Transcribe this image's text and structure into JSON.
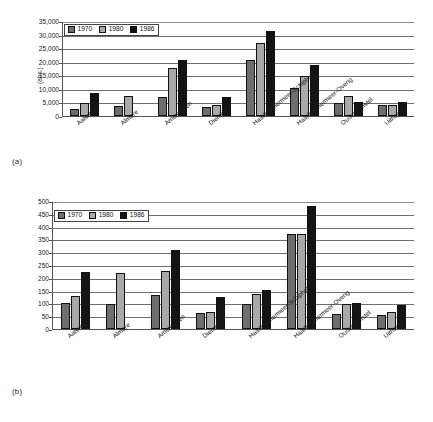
{
  "figure": {
    "panel_a_label": "(a)",
    "panel_b_label": "(b)"
  },
  "colors": {
    "series_1970": "#6e6e6e",
    "series_1980": "#a9a9a9",
    "series_1986": "#141414",
    "gridline": "#6f6f6f",
    "axis": "#555555"
  },
  "chart_data": [
    {
      "type": "bar",
      "id": "a",
      "title": "",
      "panel_label": "(a)",
      "xlabel": "",
      "ylabel": "(abs.)",
      "ylim": [
        0,
        35000
      ],
      "yticks": [
        0,
        5000,
        10000,
        15000,
        20000,
        25000,
        30000,
        35000
      ],
      "ytick_labels": [
        "0",
        "5,000",
        "10,000",
        "15,000",
        "20,000",
        "25,000",
        "30,000",
        "35,000"
      ],
      "grid": true,
      "legend_position": "top-left",
      "categories": [
        "Aalsmeer",
        "Almere",
        "Amstelveen",
        "Diemen",
        "Haarlemmermeer-Schiphol",
        "Haarlemmermeer-Overig",
        "Ouder-Amstel",
        "Uithoorn"
      ],
      "series": [
        {
          "name": "1970",
          "color": "#6e6e6e",
          "values": [
            2700,
            3700,
            6900,
            3400,
            20800,
            10200,
            4800,
            4100
          ]
        },
        {
          "name": "1980",
          "color": "#a9a9a9",
          "values": [
            4800,
            7400,
            17800,
            4000,
            27000,
            14800,
            7200,
            4000
          ]
        },
        {
          "name": "1986",
          "color": "#141414",
          "values": [
            8500,
            0,
            20800,
            6900,
            31500,
            18900,
            5000,
            5300
          ]
        }
      ]
    },
    {
      "type": "bar",
      "id": "b",
      "title": "",
      "panel_label": "(b)",
      "xlabel": "",
      "ylabel": "",
      "ylim": [
        0,
        500
      ],
      "yticks": [
        0,
        50,
        100,
        150,
        200,
        250,
        300,
        350,
        400,
        450,
        500
      ],
      "ytick_labels": [
        "0",
        "50",
        "100",
        "150",
        "200",
        "250",
        "300",
        "350",
        "400",
        "450",
        "500"
      ],
      "grid": true,
      "legend_position": "top-left",
      "categories": [
        "Aalsmeer",
        "Almere",
        "Amstelveen",
        "Diemen",
        "Haarlemmermeer-Schiphol",
        "Haarlemmermeer-Overig",
        "Ouder-Amstel",
        "Uithoorn"
      ],
      "series": [
        {
          "name": "1970",
          "color": "#6e6e6e",
          "values": [
            101,
            96,
            133,
            62,
            99,
            373,
            57,
            55
          ]
        },
        {
          "name": "1980",
          "color": "#a9a9a9",
          "values": [
            128,
            219,
            228,
            66,
            135,
            370,
            97,
            65
          ]
        },
        {
          "name": "1986",
          "color": "#141414",
          "values": [
            222,
            0,
            308,
            125,
            152,
            480,
            103,
            92
          ]
        }
      ]
    }
  ]
}
